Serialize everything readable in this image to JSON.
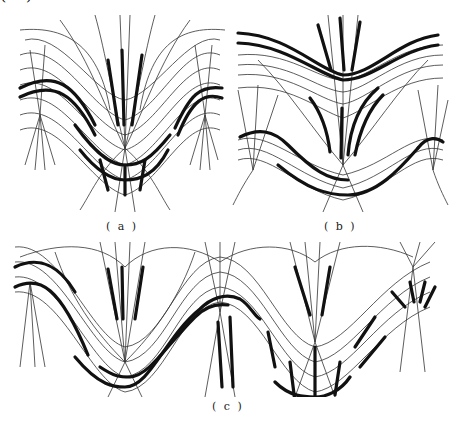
{
  "figure": {
    "panels": [
      {
        "id": "a",
        "caption": "( a )"
      },
      {
        "id": "b",
        "caption": "( b )"
      },
      {
        "id": "c",
        "caption": "( c )"
      }
    ]
  }
}
